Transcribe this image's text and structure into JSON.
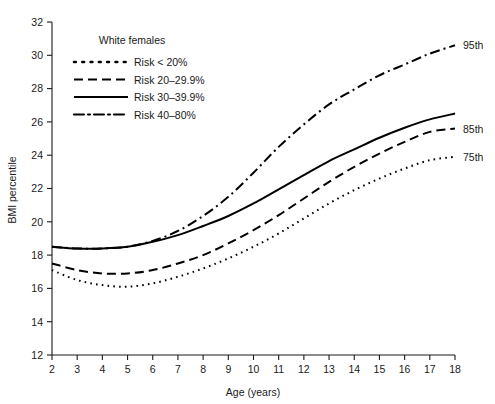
{
  "chart_data": {
    "type": "line",
    "title": "",
    "xlabel": "Age (years)",
    "ylabel": "BMI percentile",
    "xlim": [
      2,
      18
    ],
    "ylim": [
      12,
      32
    ],
    "xticks": [
      2,
      3,
      4,
      5,
      6,
      7,
      8,
      9,
      10,
      11,
      12,
      13,
      14,
      15,
      16,
      17,
      18
    ],
    "xtick_labels": [
      "2",
      "3",
      "4",
      "5",
      "6",
      "7",
      "8",
      "9",
      "10",
      "11",
      "12",
      "13",
      "14",
      "15",
      "16",
      "17",
      "18"
    ],
    "yticks": [
      12,
      14,
      16,
      18,
      20,
      22,
      24,
      26,
      28,
      30,
      32
    ],
    "ytick_labels": [
      "12",
      "14",
      "16",
      "18",
      "20",
      "22",
      "24",
      "26",
      "28",
      "30",
      "32"
    ],
    "grid": false,
    "legend_position": "upper-left-inside",
    "legend_title": "White females",
    "x": [
      2,
      3,
      4,
      5,
      6,
      7,
      8,
      9,
      10,
      11,
      12,
      13,
      14,
      15,
      16,
      17,
      18
    ],
    "series": [
      {
        "name": "Risk < 20%",
        "style": "dotted",
        "end_label": "75th",
        "values": [
          17.1,
          16.5,
          16.2,
          16.1,
          16.3,
          16.7,
          17.2,
          17.8,
          18.5,
          19.3,
          20.2,
          21.1,
          21.9,
          22.6,
          23.2,
          23.7,
          23.9
        ]
      },
      {
        "name": "Risk 20–29.9%",
        "style": "dashed",
        "end_label": "85th",
        "values": [
          17.5,
          17.1,
          16.9,
          16.9,
          17.1,
          17.5,
          18.0,
          18.7,
          19.5,
          20.4,
          21.4,
          22.4,
          23.3,
          24.1,
          24.8,
          25.4,
          25.6
        ]
      },
      {
        "name": "Risk 30–39.9%",
        "style": "solid",
        "end_label": "",
        "values": [
          18.5,
          18.4,
          18.4,
          18.5,
          18.8,
          19.3,
          20.0,
          20.8,
          21.8,
          22.9,
          24.0,
          25.1,
          26.0,
          26.9,
          27.6,
          28.2,
          28.6
        ]
      },
      {
        "name": "Risk 40–80%",
        "style": "dashdot",
        "end_label": "95th",
        "values": [
          18.5,
          18.4,
          18.4,
          18.5,
          18.8,
          19.3,
          20.0,
          20.8,
          21.8,
          22.9,
          24.0,
          25.1,
          26.0,
          26.9,
          27.6,
          28.2,
          28.6
        ]
      }
    ],
    "annotations": [
      {
        "text": "95th",
        "x": 18,
        "y": 30.6
      },
      {
        "text": "85th",
        "x": 18,
        "y": 25.6
      },
      {
        "text": "75th",
        "x": 18,
        "y": 23.9
      }
    ]
  },
  "legend": {
    "title": "White females",
    "items": [
      {
        "label": "Risk < 20%",
        "style": "dotted"
      },
      {
        "label": "Risk 20–29.9%",
        "style": "dashed"
      },
      {
        "label": "Risk 30–39.9%",
        "style": "solid"
      },
      {
        "label": "Risk 40–80%",
        "style": "dashdot"
      }
    ]
  },
  "colors": {
    "ink": "#1a1a1a",
    "curve": "#000000",
    "background": "#ffffff"
  }
}
